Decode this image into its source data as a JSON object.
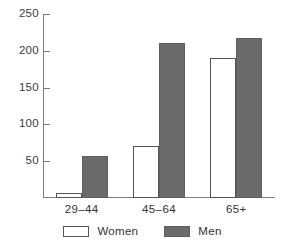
{
  "chart_data": {
    "type": "bar",
    "title": "",
    "subtitle": "",
    "xlabel": "",
    "ylabel": "",
    "categories": [
      "29‒44",
      "45‒64",
      "65+"
    ],
    "series": [
      {
        "name": "Women",
        "color": "#ffffff",
        "values": [
          7,
          71,
          190
        ]
      },
      {
        "name": "Men",
        "color": "#6b6b6b",
        "values": [
          57,
          211,
          217
        ]
      }
    ],
    "ylim": [
      0,
      250
    ],
    "yticks": [
      50,
      100,
      150,
      200,
      250
    ],
    "ytick_labels": [
      "50",
      "100",
      "150",
      "200",
      "250"
    ],
    "grid": false,
    "legend_position": "bottom",
    "axis_color": "#7c7c7c",
    "text_color": "#333333"
  },
  "legend": {
    "items": [
      {
        "label": "Women",
        "swatch": "white-swatch"
      },
      {
        "label": "Men",
        "swatch": "gray-swatch"
      }
    ]
  }
}
